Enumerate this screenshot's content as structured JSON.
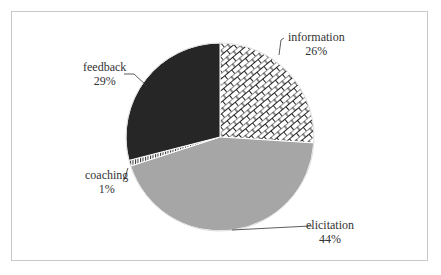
{
  "chart_data": {
    "type": "pie",
    "title": "",
    "categories": [
      "information",
      "elicitation",
      "coaching",
      "feedback"
    ],
    "values": [
      26,
      44,
      1,
      29
    ],
    "unit": "%",
    "start_angle": "12 o'clock, clockwise",
    "slices": [
      {
        "name": "information",
        "value": 26,
        "label": "26%",
        "fill": "brick-hatch pattern (black on white)"
      },
      {
        "name": "elicitation",
        "value": 44,
        "label": "44%",
        "fill": "#a6a6a6"
      },
      {
        "name": "coaching",
        "value": 1,
        "label": "1%",
        "fill": "vertical-line hatch"
      },
      {
        "name": "feedback",
        "value": 29,
        "label": "29%",
        "fill": "#262626"
      }
    ],
    "legend": "none (data labels with leader lines)"
  },
  "labels": {
    "information": {
      "name": "information",
      "pct": "26%"
    },
    "elicitation": {
      "name": "elicitation",
      "pct": "44%"
    },
    "coaching": {
      "name": "coaching",
      "pct": "1%"
    },
    "feedback": {
      "name": "feedback",
      "pct": "29%"
    }
  }
}
